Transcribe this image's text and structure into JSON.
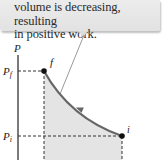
{
  "callout": {
    "line1": "volume is decreasing, resulting",
    "line2": "in positive work."
  },
  "diagram": {
    "y_axis_label": "P",
    "pf_label": "P",
    "pf_sub": "f",
    "pi_label": "P",
    "pi_sub": "i",
    "point_f_label": "f",
    "point_i_label": "i",
    "curve_color": "#666666",
    "fill_color": "#e4e4e4"
  }
}
